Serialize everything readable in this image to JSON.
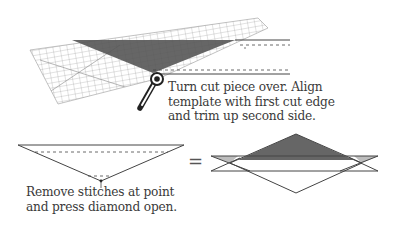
{
  "step_top": {
    "caption_lines": [
      "Turn cut piece over. Align",
      "template with first cut edge",
      "and trim up second side."
    ],
    "icons": [
      "ruler-template-icon",
      "rotary-cutter-icon"
    ]
  },
  "step_bottom": {
    "caption_lines": [
      "Remove stitches at point",
      "and press diamond open."
    ],
    "equals_symbol": "="
  },
  "colors": {
    "dark_fill": "#555555",
    "light_fill": "#bdbdbd",
    "line": "#444444",
    "text": "#3a3a3a"
  }
}
